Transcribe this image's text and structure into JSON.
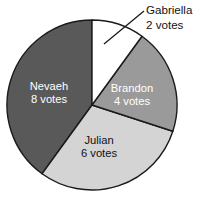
{
  "chart_data": {
    "type": "pie",
    "title": "",
    "subtitle": "",
    "xlabel": "",
    "ylabel": "",
    "unit": "votes",
    "total": 20,
    "start_angle_deg": 0,
    "direction": "clockwise",
    "legend_position": "none",
    "grid": false,
    "categories": [
      "Gabriella",
      "Brandon",
      "Julian",
      "Nevaeh"
    ],
    "values": [
      2,
      4,
      6,
      8
    ],
    "slices": [
      {
        "name": "Gabriella",
        "value": 2,
        "value_text": "2 votes",
        "percent": 10,
        "angle_deg": 36,
        "start_deg": 0,
        "end_deg": 36,
        "color": "#ffffff",
        "label_style": "callout",
        "label_color": "#111111"
      },
      {
        "name": "Brandon",
        "value": 4,
        "value_text": "4 votes",
        "percent": 20,
        "angle_deg": 72,
        "start_deg": 36,
        "end_deg": 108,
        "color": "#9a9a9a",
        "label_style": "inside",
        "label_color": "#ffffff"
      },
      {
        "name": "Julian",
        "value": 6,
        "value_text": "6 votes",
        "percent": 30,
        "angle_deg": 108,
        "start_deg": 108,
        "end_deg": 216,
        "color": "#d4d4d4",
        "label_style": "inside",
        "label_color": "#111111"
      },
      {
        "name": "Nevaeh",
        "value": 8,
        "value_text": "8 votes",
        "percent": 40,
        "angle_deg": 144,
        "start_deg": 216,
        "end_deg": 360,
        "color": "#595959",
        "label_style": "inside",
        "label_color": "#111111"
      }
    ],
    "colors": {
      "gabriella": "#ffffff",
      "brandon": "#9a9a9a",
      "julian": "#d4d4d4",
      "nevaeh": "#595959",
      "outline": "#1a1a1a",
      "background": "#ffffff"
    }
  },
  "labels": {
    "gabriella_name": "Gabriella",
    "gabriella_votes": "2 votes",
    "brandon_name": "Brandon",
    "brandon_votes": "4 votes",
    "julian_name": "Julian",
    "julian_votes": "6 votes",
    "nevaeh_name": "Nevaeh",
    "nevaeh_votes": "8 votes"
  }
}
